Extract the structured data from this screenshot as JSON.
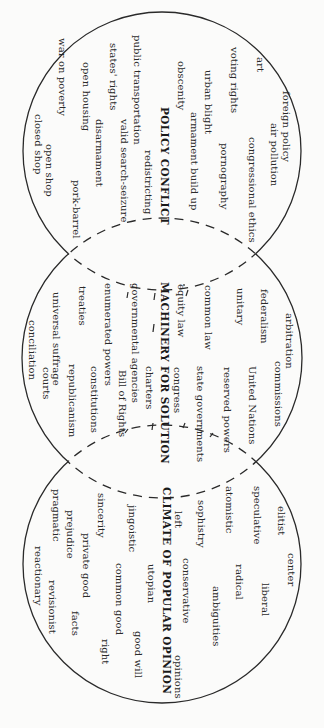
{
  "diagram": {
    "type": "three-circle venn (rotated 90 degrees)",
    "colors": {
      "line": "#2a2a2a",
      "text": "#2a2a2a",
      "background": "#fbfbfa"
    },
    "circles": [
      {
        "id": "policy",
        "cx": 162,
        "cy": 151,
        "r": 139
      },
      {
        "id": "machinery",
        "cx": 162,
        "cy": 358,
        "r": 140
      },
      {
        "id": "climate",
        "cx": 162,
        "cy": 564,
        "r": 139
      }
    ],
    "groups": {
      "policy": {
        "heading": {
          "text": "POLICY CONFLICT",
          "x": 170,
          "y": 107
        },
        "terms": [
          {
            "text": "foreign policy",
            "x": 292,
            "y": 91
          },
          {
            "text": "air pollution",
            "x": 280,
            "y": 123
          },
          {
            "text": "art",
            "x": 266,
            "y": 57
          },
          {
            "text": "congressional ethics",
            "x": 258,
            "y": 137
          },
          {
            "text": "voting rights",
            "x": 240,
            "y": 47
          },
          {
            "text": "pornography",
            "x": 230,
            "y": 143
          },
          {
            "text": "urban blight",
            "x": 214,
            "y": 70
          },
          {
            "text": "armament build up",
            "x": 200,
            "y": 112
          },
          {
            "text": "obscenity",
            "x": 187,
            "y": 61
          },
          {
            "text": "redistricting",
            "x": 154,
            "y": 150
          },
          {
            "text": "public transportation",
            "x": 143,
            "y": 35
          },
          {
            "text": "valid search-seizure",
            "x": 130,
            "y": 119
          },
          {
            "text": "states' rights",
            "x": 119,
            "y": 43
          },
          {
            "text": "disarmament",
            "x": 105,
            "y": 119
          },
          {
            "text": "open housing",
            "x": 92,
            "y": 62
          },
          {
            "text": "pork-barrel",
            "x": 82,
            "y": 180
          },
          {
            "text": "war on poverty",
            "x": 68,
            "y": 38
          },
          {
            "text": "open shop",
            "x": 55,
            "y": 144
          },
          {
            "text": "closed shop",
            "x": 44,
            "y": 114
          }
        ]
      },
      "machinery": {
        "heading": {
          "text": "MACHINERY FOR SOLUTION",
          "x": 170,
          "y": 282
        },
        "terms": [
          {
            "text": "arbitration",
            "x": 295,
            "y": 313
          },
          {
            "text": "commissions",
            "x": 284,
            "y": 361
          },
          {
            "text": "federalism",
            "x": 270,
            "y": 289
          },
          {
            "text": "United Nations",
            "x": 258,
            "y": 366
          },
          {
            "text": "unitary",
            "x": 246,
            "y": 288
          },
          {
            "text": "reserved powers",
            "x": 233,
            "y": 367
          },
          {
            "text": "common law",
            "x": 214,
            "y": 285
          },
          {
            "text": "state governments",
            "x": 206,
            "y": 366
          },
          {
            "text": "equity law",
            "x": 187,
            "y": 284
          },
          {
            "text": "congress",
            "x": 183,
            "y": 367
          },
          {
            "text": "charters",
            "x": 155,
            "y": 366
          },
          {
            "text": "governmental agencies",
            "x": 141,
            "y": 283
          },
          {
            "text": "Bill of Rights",
            "x": 128,
            "y": 370
          },
          {
            "text": "enumerated powers",
            "x": 114,
            "y": 283
          },
          {
            "text": "constitutions",
            "x": 100,
            "y": 366
          },
          {
            "text": "treaties",
            "x": 88,
            "y": 286
          },
          {
            "text": "republicanism",
            "x": 78,
            "y": 364
          },
          {
            "text": "universal suffrage",
            "x": 62,
            "y": 292
          },
          {
            "text": "courts",
            "x": 52,
            "y": 367
          },
          {
            "text": "conciliation",
            "x": 38,
            "y": 320
          }
        ]
      },
      "climate": {
        "heading": {
          "text": "CLIMATE OF POPULAR OPINION",
          "x": 172,
          "y": 487
        },
        "terms": [
          {
            "text": "center",
            "x": 297,
            "y": 553
          },
          {
            "text": "elitist",
            "x": 287,
            "y": 506
          },
          {
            "text": "liberal",
            "x": 271,
            "y": 583
          },
          {
            "text": "speculative",
            "x": 263,
            "y": 486
          },
          {
            "text": "radical",
            "x": 245,
            "y": 564
          },
          {
            "text": "atomistic",
            "x": 235,
            "y": 486
          },
          {
            "text": "ambiguities",
            "x": 222,
            "y": 586
          },
          {
            "text": "sophistry",
            "x": 207,
            "y": 500
          },
          {
            "text": "conservative",
            "x": 192,
            "y": 558
          },
          {
            "text": "opinions",
            "x": 184,
            "y": 655
          },
          {
            "text": "left",
            "x": 184,
            "y": 511
          },
          {
            "text": "utopian",
            "x": 157,
            "y": 564
          },
          {
            "text": "good will",
            "x": 144,
            "y": 631
          },
          {
            "text": "jingoistic",
            "x": 138,
            "y": 505
          },
          {
            "text": "common good",
            "x": 125,
            "y": 563
          },
          {
            "text": "right",
            "x": 111,
            "y": 639
          },
          {
            "text": "sincerity",
            "x": 107,
            "y": 493
          },
          {
            "text": "private good",
            "x": 92,
            "y": 533
          },
          {
            "text": "facts",
            "x": 81,
            "y": 611
          },
          {
            "text": "prejudice",
            "x": 76,
            "y": 510
          },
          {
            "text": "revisionist",
            "x": 58,
            "y": 580
          },
          {
            "text": "pragmatic",
            "x": 62,
            "y": 489
          },
          {
            "text": "reactionary",
            "x": 44,
            "y": 546
          }
        ]
      }
    },
    "connector_marks": [
      {
        "x1": 155,
        "y1": 293,
        "x2": 154,
        "y2": 300
      },
      {
        "x1": 128,
        "y1": 292,
        "x2": 127,
        "y2": 298
      },
      {
        "x1": 154,
        "y1": 324,
        "x2": 153,
        "y2": 332
      },
      {
        "x1": 188,
        "y1": 290,
        "x2": 186,
        "y2": 296
      },
      {
        "x1": 185,
        "y1": 423,
        "x2": 183,
        "y2": 428
      },
      {
        "x1": 153,
        "y1": 423,
        "x2": 152,
        "y2": 430
      },
      {
        "x1": 128,
        "y1": 429,
        "x2": 125,
        "y2": 433
      },
      {
        "x1": 213,
        "y1": 433,
        "x2": 210,
        "y2": 437
      },
      {
        "x1": 184,
        "y1": 284,
        "x2": 184,
        "y2": 286
      }
    ]
  }
}
